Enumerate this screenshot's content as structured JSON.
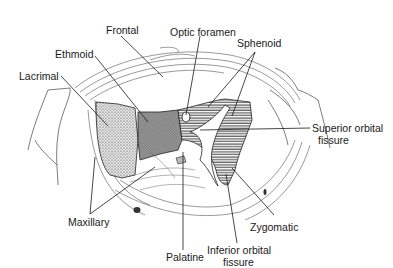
{
  "diagram": {
    "labels": {
      "frontal": "Frontal",
      "optic_foramen": "Optic foramen",
      "ethmoid": "Ethmoid",
      "sphenoid": "Sphenoid",
      "lacrimal": "Lacrimal",
      "superior_orbital_fissure_line1": "Superior orbital",
      "superior_orbital_fissure_line2": "fissure",
      "maxillary": "Maxillary",
      "zygomatic": "Zygomatic",
      "palatine": "Palatine",
      "inferior_orbital_fissure_line1": "Inferior orbital",
      "inferior_orbital_fissure_line2": "fissure"
    },
    "colors": {
      "line": "#1a1a1a",
      "ethmoid_fill": "#8c8c8c",
      "lacrimal_fill": "#c8c8c8",
      "background": "#ffffff"
    }
  }
}
